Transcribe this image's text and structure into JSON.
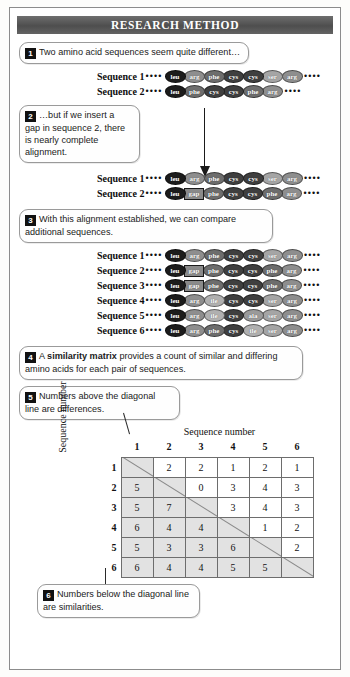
{
  "header": {
    "title": "RESEARCH METHOD"
  },
  "steps": [
    {
      "num": "1",
      "text": "Two amino acid sequences seem quite different…"
    },
    {
      "num": "2",
      "text": "…but if we insert a gap in sequence 2, there is nearly complete alignment."
    },
    {
      "num": "3",
      "text": "With this alignment established, we can compare additional sequences."
    },
    {
      "num": "4",
      "text_before": "A ",
      "bold": "similarity matrix",
      "text_after": " provides a count of similar and differing amino acids for each pair of sequences."
    },
    {
      "num": "5",
      "text": "Numbers above the diagonal line are differences."
    },
    {
      "num": "6",
      "text": "Numbers below the diagonal line are similarities."
    }
  ],
  "dots": "••••",
  "panel1": {
    "rows": [
      {
        "label": "Sequence 1",
        "residues": [
          "leu",
          "arg",
          "phe",
          "cys",
          "cys",
          "ser",
          "arg"
        ]
      },
      {
        "label": "Sequence 2",
        "residues": [
          "leu",
          "phe",
          "cys",
          "cys",
          "phe",
          "arg"
        ]
      }
    ]
  },
  "panel2": {
    "rows": [
      {
        "label": "Sequence 1",
        "residues": [
          "leu",
          "arg",
          "phe",
          "cys",
          "cys",
          "ser",
          "arg"
        ]
      },
      {
        "label": "Sequence 2",
        "residues": [
          "leu",
          "gap",
          "phe",
          "cys",
          "cys",
          "phe",
          "arg"
        ]
      }
    ]
  },
  "panel3": {
    "rows": [
      {
        "label": "Sequence 1",
        "residues": [
          "leu",
          "arg",
          "phe",
          "cys",
          "cys",
          "ser",
          "arg"
        ]
      },
      {
        "label": "Sequence 2",
        "residues": [
          "leu",
          "gap",
          "phe",
          "cys",
          "cys",
          "phe",
          "arg"
        ]
      },
      {
        "label": "Sequence 3",
        "residues": [
          "leu",
          "gap",
          "phe",
          "cys",
          "cys",
          "phe",
          "arg"
        ]
      },
      {
        "label": "Sequence 4",
        "residues": [
          "leu",
          "arg",
          "ile",
          "cys",
          "cys",
          "ser",
          "arg"
        ]
      },
      {
        "label": "Sequence 5",
        "residues": [
          "leu",
          "arg",
          "ile",
          "cys",
          "ala",
          "ser",
          "arg"
        ]
      },
      {
        "label": "Sequence 6",
        "residues": [
          "leu",
          "arg",
          "phe",
          "cys",
          "ile",
          "ser",
          "arg"
        ]
      }
    ]
  },
  "residue_colors": {
    "leu": "#1c1c1c",
    "arg": "#8e8e8e",
    "phe": "#6d6d6d",
    "cys": "#3f3f3f",
    "ser": "#a5a5a5",
    "ile": "#b0b0b0",
    "ala": "#9a9a9a",
    "gap": "#8a8a8a"
  },
  "matrix": {
    "top_label": "Sequence number",
    "side_label": "Sequence number",
    "col_headers": [
      "1",
      "2",
      "3",
      "4",
      "5",
      "6"
    ],
    "row_headers": [
      "1",
      "2",
      "3",
      "4",
      "5",
      "6"
    ],
    "cells": [
      [
        "",
        "2",
        "2",
        "1",
        "2",
        "1"
      ],
      [
        "5",
        "",
        "0",
        "3",
        "4",
        "3"
      ],
      [
        "5",
        "7",
        "",
        "3",
        "4",
        "3"
      ],
      [
        "6",
        "4",
        "4",
        "",
        "1",
        "2"
      ],
      [
        "5",
        "3",
        "3",
        "6",
        "",
        "2"
      ],
      [
        "6",
        "4",
        "4",
        "5",
        "5",
        ""
      ]
    ]
  }
}
